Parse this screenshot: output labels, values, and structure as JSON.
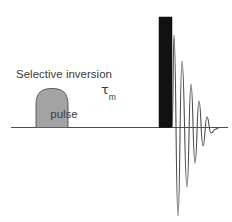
{
  "figure": {
    "kind": "nmr-pulse-sequence-diagram",
    "background_color": "#ffffff",
    "line_color": "#4d4d4d",
    "pulse_fill_color": "#a3a3a3",
    "pulse_stroke_color": "#5a5a5a",
    "hard_pulse_color": "#111111",
    "text_color": "#3c3c3c"
  },
  "labels": {
    "selective_pulse": {
      "line1": "Selective inversion",
      "line2": "pulse"
    },
    "mixing_time": {
      "symbol": "τ",
      "subscript": "m"
    }
  },
  "chart_data": {
    "type": "line",
    "title": "",
    "xlabel": "",
    "ylabel": "",
    "grid": false,
    "legend": null,
    "axis": {
      "baseline_y": 127,
      "baseline_x_start": 11,
      "baseline_x_end": 228
    },
    "elements": [
      {
        "name": "selective-inversion-pulse",
        "shape": "rounded-top-shaped-pulse",
        "fill": "#a3a3a3",
        "x_start": 36,
        "x_end": 68,
        "peak_y": 88,
        "baseline_y": 127
      },
      {
        "name": "hard-90-pulse",
        "shape": "filled-rectangle",
        "fill": "#111111",
        "x_start": 159,
        "x_end": 172,
        "y_top": 17,
        "y_bottom": 127
      },
      {
        "name": "free-induction-decay",
        "shape": "damped-oscillation",
        "stroke": "#4d4d4d",
        "x_start": 173,
        "x_end": 228,
        "baseline_y": 127,
        "peaks_above": [
          35,
          61,
          84,
          101,
          117
        ],
        "troughs_below": [
          216,
          187,
          163,
          146,
          133
        ],
        "peak_x": [
          174,
          182,
          191,
          199,
          207
        ],
        "trough_x": [
          178,
          187,
          195,
          203,
          211
        ]
      }
    ]
  }
}
